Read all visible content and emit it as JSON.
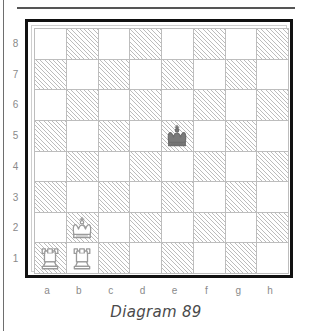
{
  "caption": "Diagram 89",
  "board": {
    "rank_labels": [
      "8",
      "7",
      "6",
      "5",
      "4",
      "3",
      "2",
      "1"
    ],
    "file_labels": [
      "a",
      "b",
      "c",
      "d",
      "e",
      "f",
      "g",
      "h"
    ],
    "light_square_color": "#ffffff",
    "dark_square_color": "#bcbcbc",
    "grid_line_color": "#bdbdbd",
    "frame_color": "#111111",
    "label_color": "#8a8a8a",
    "orientation": "white-bottom",
    "squares_per_side": 8
  },
  "pieces": [
    {
      "square": "e5",
      "file": "e",
      "rank": "5",
      "color": "black",
      "type": "king",
      "icon": "black-king-icon",
      "glyph": "♚"
    },
    {
      "square": "b2",
      "file": "b",
      "rank": "2",
      "color": "white",
      "type": "king",
      "icon": "white-king-icon",
      "glyph": "♔"
    },
    {
      "square": "a1",
      "file": "a",
      "rank": "1",
      "color": "white",
      "type": "rook",
      "icon": "white-rook-icon",
      "glyph": "♖"
    },
    {
      "square": "b1",
      "file": "b",
      "rank": "1",
      "color": "white",
      "type": "rook",
      "icon": "white-rook-icon",
      "glyph": "♖"
    }
  ],
  "chart_data": {
    "type": "table",
    "title": "Diagram 89",
    "categories": [
      "a",
      "b",
      "c",
      "d",
      "e",
      "f",
      "g",
      "h"
    ],
    "rows": [
      "8",
      "7",
      "6",
      "5",
      "4",
      "3",
      "2",
      "1"
    ],
    "position_fen": "8/8/8/4k3/8/8/1K6/RR6",
    "piece_placement": {
      "a1": "white rook",
      "b1": "white rook",
      "b2": "white king",
      "e5": "black king"
    },
    "white_pieces": [
      "Ra1",
      "Rb1",
      "Kb2"
    ],
    "black_pieces": [
      "Ke5"
    ],
    "xlabel": "",
    "ylabel": "",
    "grid": true,
    "legend": ""
  }
}
